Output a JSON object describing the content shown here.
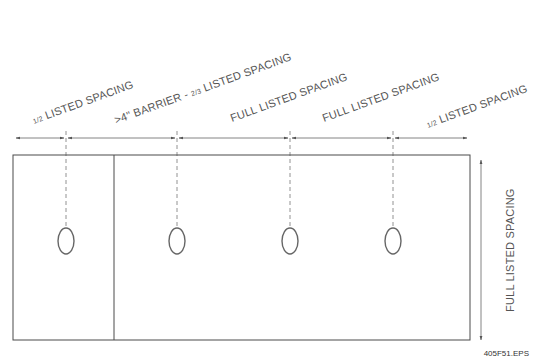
{
  "diagram": {
    "type": "sprinkler spacing plan view",
    "colors": {
      "line": "#4a4a4a",
      "text": "#555555",
      "dashed": "#777777",
      "background": "#ffffff"
    },
    "labels": {
      "seg1": {
        "frac": "1/2",
        "text": " LISTED SPACING"
      },
      "seg2": {
        "prefix": ">4\" BARRIER - ",
        "frac": "2/3",
        "text": " LISTED SPACING"
      },
      "seg3": {
        "text": "FULL LISTED SPACING"
      },
      "seg4": {
        "text": "FULL LISTED SPACING"
      },
      "seg5": {
        "frac": "1/2",
        "text": " LISTED SPACING"
      },
      "vertical": {
        "text": "FULL LISTED SPACING"
      }
    },
    "sprinkler_count": 4,
    "barrier": true,
    "figure_id": "405F51.EPS"
  }
}
